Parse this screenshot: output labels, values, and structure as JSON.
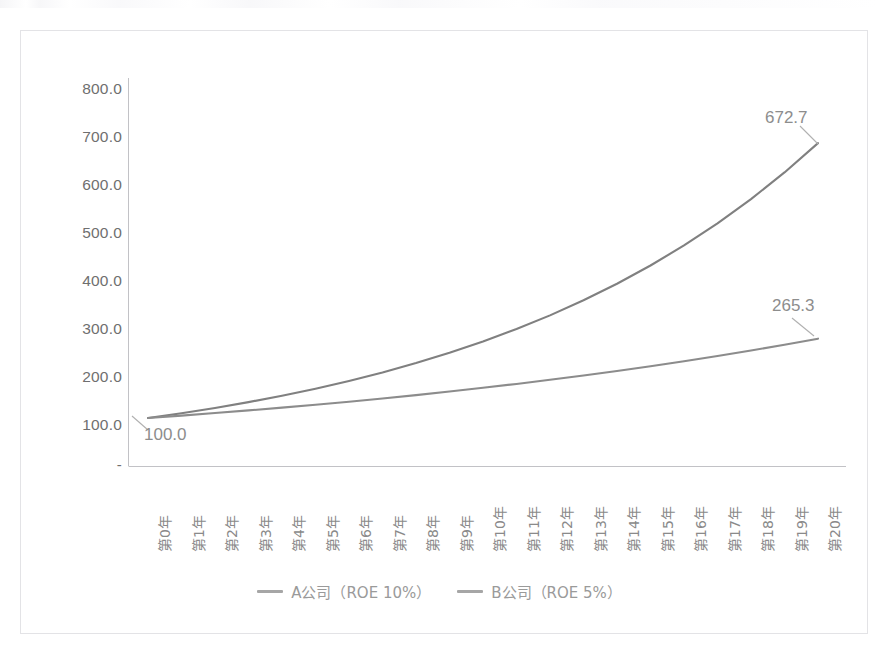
{
  "chart_data": {
    "type": "line",
    "title": "",
    "xlabel": "",
    "ylabel": "",
    "grid": false,
    "legend_position": "bottom",
    "categories": [
      "第0年",
      "第1年",
      "第2年",
      "第3年",
      "第4年",
      "第5年",
      "第6年",
      "第7年",
      "第8年",
      "第9年",
      "第10年",
      "第11年",
      "第12年",
      "第13年",
      "第14年",
      "第15年",
      "第16年",
      "第17年",
      "第18年",
      "第19年",
      "第20年"
    ],
    "ylim": [
      0,
      800
    ],
    "yticks": [
      "-",
      "100.0",
      "200.0",
      "300.0",
      "400.0",
      "500.0",
      "600.0",
      "700.0",
      "800.0"
    ],
    "ytick_values": [
      0,
      100,
      200,
      300,
      400,
      500,
      600,
      700,
      800
    ],
    "series": [
      {
        "name": "A公司（ROE 10%）",
        "color": "#808080",
        "values": [
          100.0,
          110.0,
          121.0,
          133.1,
          146.4,
          161.1,
          177.2,
          194.9,
          214.4,
          235.8,
          259.4,
          285.3,
          313.8,
          345.2,
          379.7,
          417.7,
          459.5,
          505.4,
          556.0,
          611.6,
          672.7
        ]
      },
      {
        "name": "B公司（ROE 5%）",
        "color": "#8c8c8c",
        "values": [
          100.0,
          105.0,
          110.3,
          115.8,
          121.6,
          127.6,
          134.0,
          140.7,
          147.7,
          155.1,
          162.9,
          171.0,
          179.6,
          188.6,
          198.0,
          207.9,
          218.3,
          229.2,
          240.7,
          252.7,
          265.3
        ]
      }
    ],
    "data_labels": [
      {
        "text": "100.0",
        "series": "both",
        "point": "第0年"
      },
      {
        "text": "672.7",
        "series": "A公司（ROE 10%）",
        "point": "第20年"
      },
      {
        "text": "265.3",
        "series": "B公司（ROE 5%）",
        "point": "第20年"
      }
    ]
  },
  "axes": {
    "y_ticks": [
      {
        "label": "800.0"
      },
      {
        "label": "700.0"
      },
      {
        "label": "600.0"
      },
      {
        "label": "500.0"
      },
      {
        "label": "400.0"
      },
      {
        "label": "300.0"
      },
      {
        "label": "200.0"
      },
      {
        "label": "100.0"
      },
      {
        "label": "-"
      }
    ],
    "x_ticks": [
      {
        "label": "第0年"
      },
      {
        "label": "第1年"
      },
      {
        "label": "第2年"
      },
      {
        "label": "第3年"
      },
      {
        "label": "第4年"
      },
      {
        "label": "第5年"
      },
      {
        "label": "第6年"
      },
      {
        "label": "第7年"
      },
      {
        "label": "第8年"
      },
      {
        "label": "第9年"
      },
      {
        "label": "第10年"
      },
      {
        "label": "第11年"
      },
      {
        "label": "第12年"
      },
      {
        "label": "第13年"
      },
      {
        "label": "第14年"
      },
      {
        "label": "第15年"
      },
      {
        "label": "第16年"
      },
      {
        "label": "第17年"
      },
      {
        "label": "第18年"
      },
      {
        "label": "第19年"
      },
      {
        "label": "第20年"
      }
    ]
  },
  "labels": {
    "start": "100.0",
    "series_a_end": "672.7",
    "series_b_end": "265.3"
  },
  "legend": {
    "items": [
      {
        "label": "A公司（ROE 10%）"
      },
      {
        "label": "B公司（ROE 5%）"
      }
    ]
  },
  "colors": {
    "line_a": "#808080",
    "line_b": "#8c8c8c",
    "axis": "#b9b9bd",
    "frame": "#e3e3e6",
    "tick_text": "#6f6f6f",
    "label_text": "#8d8d8d",
    "legend_text": "#9a9a9a"
  }
}
